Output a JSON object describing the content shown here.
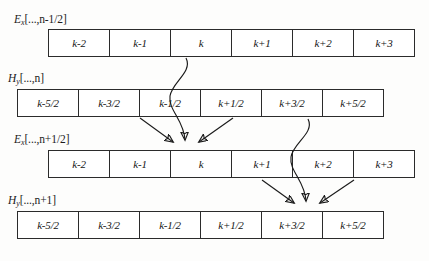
{
  "figure": {
    "type": "diagram",
    "background_color": "#fdfdfc",
    "line_color": "#1a1a1a",
    "cell_border_color": "#2b2b2b"
  },
  "rows": [
    {
      "id": "row-ex-n-minus-half",
      "label": {
        "symbol": "E",
        "subscript": "x",
        "argument": "[...,n-1/2]",
        "full_text": "Ex[...,n-1/2]"
      },
      "label_x": 14,
      "label_y": 13,
      "grid_x": 48,
      "grid_y": 29,
      "grid_width": 367,
      "cells": [
        "k-2",
        "k-1",
        "k",
        "k+1",
        "k+2",
        "k+3"
      ]
    },
    {
      "id": "row-hy-n",
      "label": {
        "symbol": "H",
        "subscript": "y",
        "argument": "[...,n]",
        "full_text": "Hy[...,n]"
      },
      "label_x": 8,
      "label_y": 72,
      "grid_x": 17,
      "grid_y": 89,
      "grid_width": 367,
      "cells": [
        "k-5/2",
        "k-3/2",
        "k-1/2",
        "k+1/2",
        "k+3/2",
        "k+5/2"
      ]
    },
    {
      "id": "row-ex-n-plus-half",
      "label": {
        "symbol": "E",
        "subscript": "x",
        "argument": "[...,n+1/2]",
        "full_text": "Ex[...,n+1/2]"
      },
      "label_x": 14,
      "label_y": 133,
      "grid_x": 48,
      "grid_y": 150,
      "grid_width": 367,
      "cells": [
        "k-2",
        "k-1",
        "k",
        "k+1",
        "k+2",
        "k+3"
      ]
    },
    {
      "id": "row-hy-n-plus-1",
      "label": {
        "symbol": "H",
        "subscript": "y",
        "argument": "[...,n+1]",
        "full_text": "Hy[...,n+1]"
      },
      "label_x": 8,
      "label_y": 194,
      "grid_x": 17,
      "grid_y": 211,
      "grid_width": 367,
      "cells": [
        "k-5/2",
        "k-3/2",
        "k-1/2",
        "k+1/2",
        "k+3/2",
        "k+5/2"
      ]
    }
  ],
  "arrows": {
    "group_left": {
      "name": "update-ex-k-at-n-plus-half",
      "target_cell": "k",
      "curved": {
        "from_row": "row-ex-n-minus-half",
        "from_cell": "k",
        "to_row": "row-ex-n-plus-half",
        "to_cell": "k",
        "path": "M 186 58 C 193 72, 172 82, 170 96 C 168 110, 184 120, 185 140"
      },
      "diagonals": [
        {
          "from_row": "row-hy-n",
          "from_cell": "k-1/2",
          "path": "M 140 118 L 173 142"
        },
        {
          "from_row": "row-hy-n",
          "from_cell": "k+1/2",
          "path": "M 233 118 L 199 142"
        }
      ]
    },
    "group_right": {
      "name": "update-hy-k-plus-three-halves-at-n-plus-1",
      "target_cell": "k+3/2",
      "curved": {
        "from_row": "row-hy-n",
        "from_cell": "k+3/2",
        "to_row": "row-hy-n-plus-1",
        "to_cell": "k+3/2",
        "path": "M 308 119 C 315 133, 293 143, 291 157 C 289 171, 305 181, 306 201"
      },
      "diagonals": [
        {
          "from_row": "row-ex-n-plus-half",
          "from_cell": "k+1",
          "path": "M 262 180 L 294 203"
        },
        {
          "from_row": "row-ex-n-plus-half",
          "from_cell": "k+2",
          "path": "M 354 180 L 320 203"
        }
      ]
    }
  }
}
